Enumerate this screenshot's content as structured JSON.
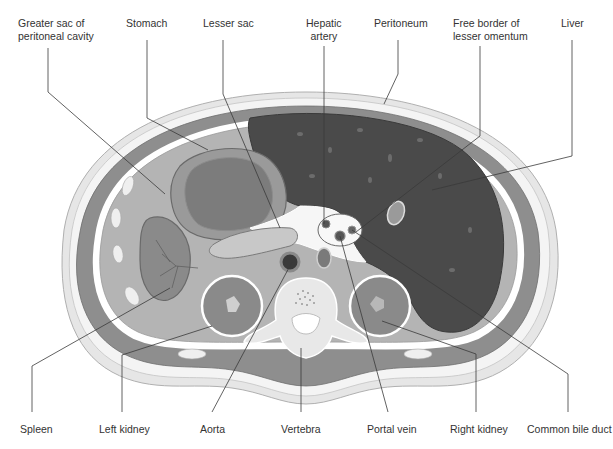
{
  "figure": {
    "type": "anatomical cross-section",
    "palette": {
      "background": "#ffffff",
      "skin": "#e6e6e6",
      "fat": "#f2f2f2",
      "muscle": "#8e8e8e",
      "peritoneal_cavity": "#b4b4b4",
      "liver": "#4a4a4a",
      "stomach": "#9a9a9a",
      "stomach_contents": "#7c7c7c",
      "kidney": "#8a8a8a",
      "bone": "#e8e8e8",
      "lesser_sac": "#f6f6f6",
      "text": "#333333",
      "leader": "#3a3a3a"
    }
  },
  "labels": {
    "top": [
      {
        "id": "greater-sac",
        "lines": [
          "Greater sac of",
          "peritoneal cavity"
        ]
      },
      {
        "id": "stomach",
        "lines": [
          "Stomach"
        ]
      },
      {
        "id": "lesser-sac",
        "lines": [
          "Lesser sac"
        ]
      },
      {
        "id": "hepatic-artery",
        "lines": [
          "Hepatic",
          "artery"
        ]
      },
      {
        "id": "peritoneum",
        "lines": [
          "Peritoneum"
        ]
      },
      {
        "id": "free-border",
        "lines": [
          "Free border of",
          "lesser omentum"
        ]
      },
      {
        "id": "liver",
        "lines": [
          "Liver"
        ]
      }
    ],
    "bottom": [
      {
        "id": "spleen",
        "lines": [
          "Spleen"
        ]
      },
      {
        "id": "left-kidney",
        "lines": [
          "Left kidney"
        ]
      },
      {
        "id": "aorta",
        "lines": [
          "Aorta"
        ]
      },
      {
        "id": "vertebra",
        "lines": [
          "Vertebra"
        ]
      },
      {
        "id": "portal-vein",
        "lines": [
          "Portal vein"
        ]
      },
      {
        "id": "right-kidney",
        "lines": [
          "Right kidney"
        ]
      },
      {
        "id": "common-bile-duct",
        "lines": [
          "Common bile duct"
        ]
      }
    ]
  }
}
